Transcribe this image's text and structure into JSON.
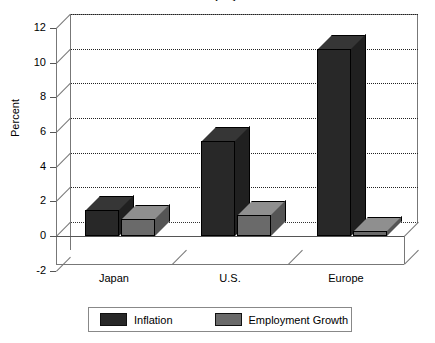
{
  "title": "Inflation and Employment Growth",
  "chart_data": {
    "type": "bar",
    "title": "Inflation and Employment Growth",
    "subtitle": "",
    "xlabel": "",
    "ylabel": "Percent",
    "categories": [
      "Japan",
      "U.S.",
      "Europe"
    ],
    "series": [
      {
        "name": "Inflation",
        "color": "#282828",
        "values": [
          1.5,
          5.5,
          10.8
        ]
      },
      {
        "name": "Employment Growth",
        "color": "#6a6a6a",
        "values": [
          1.0,
          1.2,
          0.0
        ]
      }
    ],
    "ylim": [
      -2,
      12
    ],
    "ytick_values": [
      "12",
      "10",
      "8",
      "6",
      "4",
      "2",
      "0",
      "-2"
    ],
    "ytick_step": 2,
    "grid": true,
    "grid_style": "dotted",
    "legend_position": "bottom",
    "style_3d": true
  },
  "axis": {
    "y_label": "Percent",
    "y_ticks": [
      "12",
      "10",
      "8",
      "6",
      "4",
      "2",
      "0",
      "-2"
    ],
    "x_ticks": [
      "Japan",
      "U.S.",
      "Europe"
    ]
  },
  "legend": {
    "items": [
      {
        "label": "Inflation",
        "color": "#282828"
      },
      {
        "label": "Employment Growth",
        "color": "#6a6a6a"
      }
    ]
  },
  "colors": {
    "inflation": "#282828",
    "employment": "#6a6a6a",
    "frame": "#777777",
    "grid": "#222222",
    "background": "#ffffff"
  }
}
